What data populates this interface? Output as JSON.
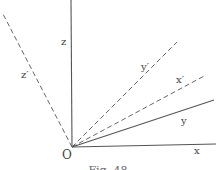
{
  "diagram": {
    "type": "coordinate-axes-rotation",
    "origin": {
      "label": "O",
      "x": 72,
      "y": 147
    },
    "stroke_color": "#555555",
    "axes": [
      {
        "id": "z",
        "label": "z",
        "style": "solid",
        "end": [
          71,
          0
        ],
        "label_pos": [
          61,
          45
        ]
      },
      {
        "id": "z-prime",
        "label": "z′",
        "style": "dashed",
        "end": [
          3,
          14
        ],
        "label_pos": [
          21,
          78
        ]
      },
      {
        "id": "y-prime",
        "label": "y′",
        "style": "dashed",
        "end": [
          177,
          42
        ],
        "label_pos": [
          141,
          70
        ]
      },
      {
        "id": "x-prime",
        "label": "x′",
        "style": "dashed",
        "end": [
          206,
          75
        ],
        "label_pos": [
          176,
          83
        ]
      },
      {
        "id": "y",
        "label": "y",
        "style": "solid",
        "end": [
          214,
          100
        ],
        "label_pos": [
          181,
          124
        ]
      },
      {
        "id": "x",
        "label": "x",
        "style": "solid",
        "end": [
          216,
          144
        ],
        "label_pos": [
          194,
          154
        ]
      }
    ],
    "caption": "Fig. 48"
  }
}
